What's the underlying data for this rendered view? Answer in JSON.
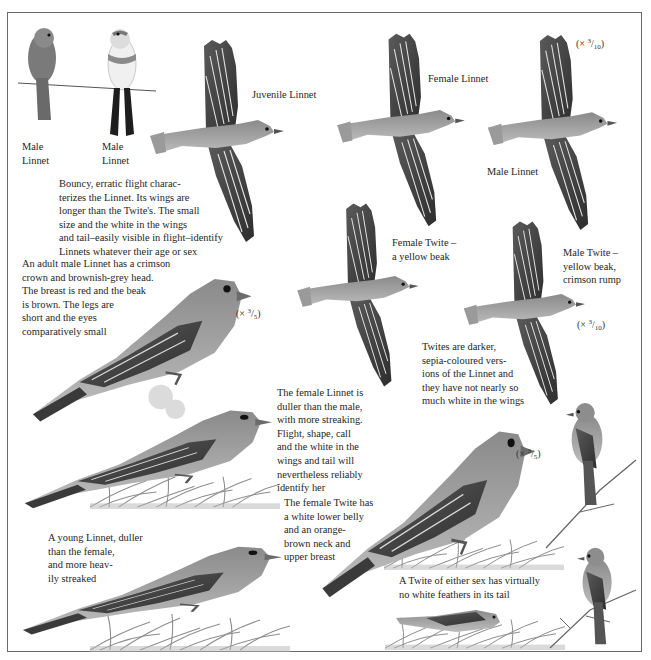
{
  "page": {
    "colors": {
      "ink": "#262626",
      "frame": "#6a6a6a",
      "bird_dark": "#3b3b3b",
      "bird_mid": "#7d7d7d",
      "bird_light": "#c9c9c9",
      "grass": "#8c8c8c"
    }
  },
  "labels": {
    "male_linnet_back": "Male\nLinnet",
    "male_linnet_front": "Male\nLinnet",
    "juvenile_linnet": "Juvenile Linnet",
    "female_linnet": "Female Linnet",
    "male_linnet_flight": "Male Linnet",
    "female_twite_flight": "Female Twite –\na yellow beak",
    "male_twite_flight": "Male Twite –\nyellow beak,\ncrimson rump"
  },
  "scales": {
    "top_right": {
      "prefix": "(× ",
      "num": "3",
      "den": "10",
      "suffix": ")"
    },
    "twite_flight": {
      "prefix": "(× ",
      "num": "3",
      "den": "10",
      "suffix": ")"
    },
    "adult_male": {
      "prefix": "(× ",
      "num": "3",
      "den": "5",
      "suffix": ")"
    },
    "female_twite": {
      "prefix": "(× ",
      "num": "3",
      "den": "5",
      "suffix": ")"
    }
  },
  "captions": {
    "flight": "Bouncy, erratic flight charac-\nterizes the Linnet. Its wings are\nlonger than the Twite's. The small\nsize and the white in the wings\nand tail–easily visible in flight–identify\nLinnets whatever their age or sex",
    "adult_male": "An adult male Linnet has a crimson\ncrown and brownish-grey head.\nThe breast is red and the beak\nis brown. The legs are\nshort and the eyes\ncomparatively small",
    "twites": "Twites are darker,\nsepia-coloured vers-\nions of the Linnet and\nthey have not nearly so\nmuch white in the wings",
    "female_linnet": "The female Linnet is\nduller than the male,\nwith more streaking.\nFlight, shape, call\nand the white in the\nwings and tail will\nnevertheless reliably\nidentify her",
    "female_twite": "The female Twite has\na white lower belly\nand an orange-\nbrown neck and\nupper breast",
    "young_linnet": "A young Linnet, duller\nthan the female,\nand more heav-\nily streaked",
    "twite_tail": "A Twite of either sex has virtually\nno white feathers in its tail"
  }
}
